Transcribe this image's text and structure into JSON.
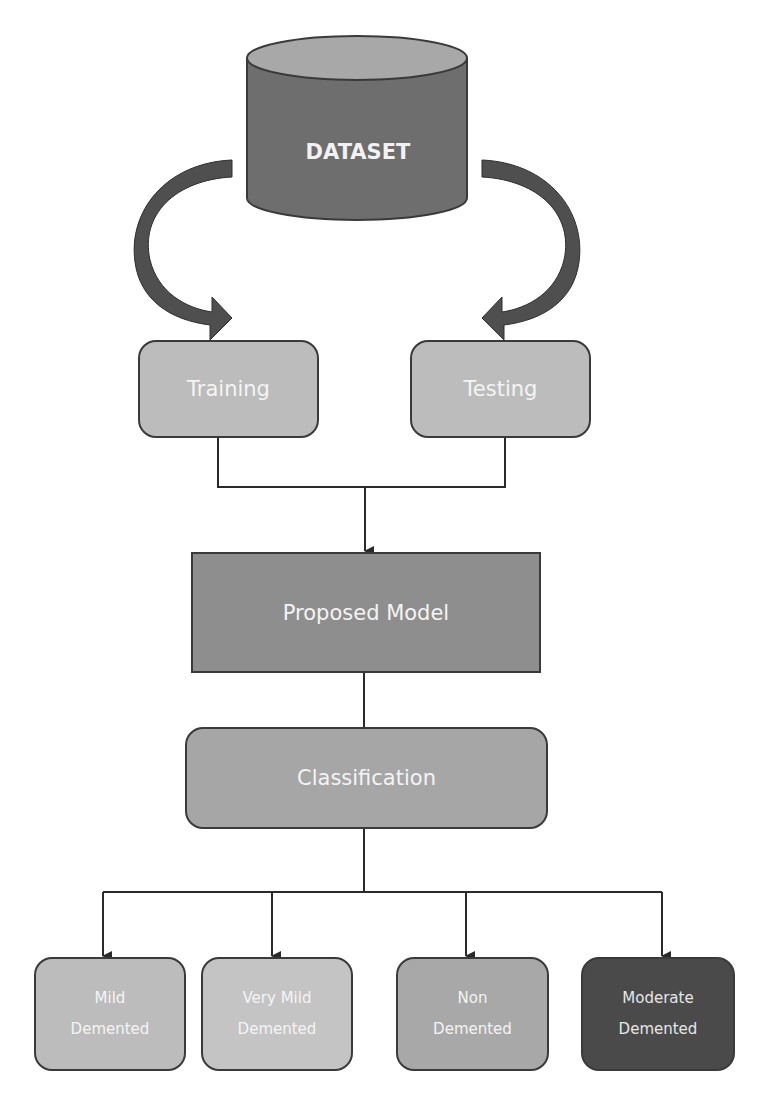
{
  "diagram": {
    "dataset": {
      "label": "DATASET",
      "shape": "cylinder",
      "color": "#6e6e6e",
      "top_color": "#a8a8a8"
    },
    "split": [
      {
        "label": "Training",
        "color": "#bcbcbc"
      },
      {
        "label": "Testing",
        "color": "#bcbcbc"
      }
    ],
    "model": {
      "label": "Proposed Model",
      "color": "#8e8e8e"
    },
    "classification": {
      "label": "Classification",
      "color": "#a6a6a6"
    },
    "classes": [
      {
        "line1": "Mild",
        "line2": "Demented",
        "color": "#bcbcbc"
      },
      {
        "line1": "Very Mild",
        "line2": "Demented",
        "color": "#c4c4c4"
      },
      {
        "line1": "Non",
        "line2": "Demented",
        "color": "#a8a8a8"
      },
      {
        "line1": "Moderate",
        "line2": "Demented",
        "color": "#4a4a4a"
      }
    ],
    "colors": {
      "line": "#2a2a2a",
      "curved_arrow": "#4f4f4f"
    }
  }
}
